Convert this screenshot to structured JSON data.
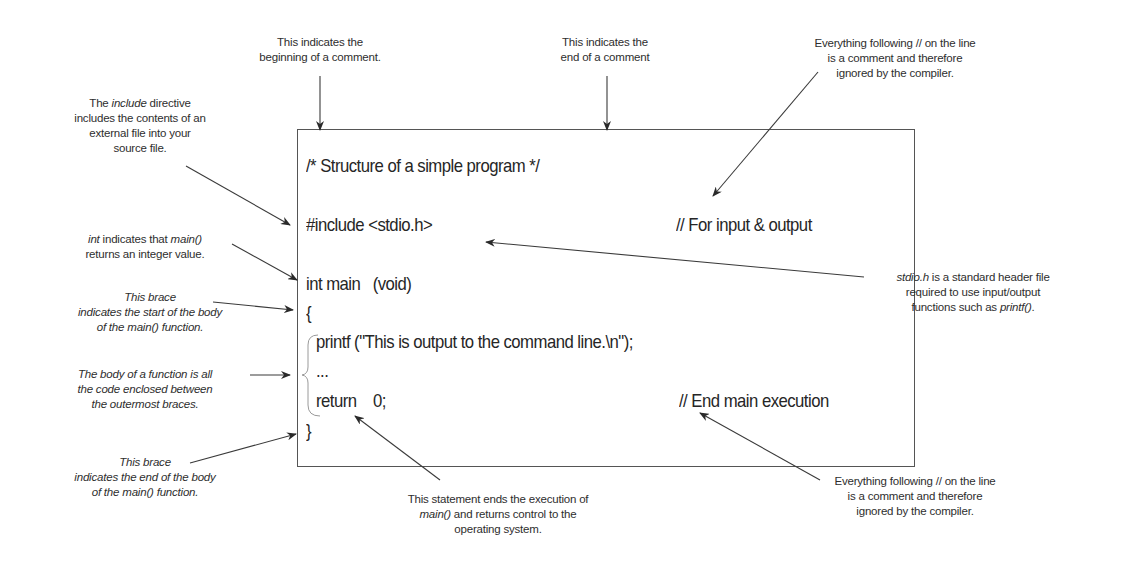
{
  "code": {
    "line_comment": "/* Structure of a simple program */",
    "line_include": "#include <stdio.h>",
    "line_include_comment": "// For input & output",
    "line_main": "int main   (void)",
    "line_open_brace": "{",
    "line_printf": "printf (\"This is output to the command line.\\n\");",
    "line_ellipsis": "...",
    "line_return": "return    0;",
    "line_return_comment": "// End main execution",
    "line_close_brace": "}"
  },
  "annotations": {
    "comment_begin": [
      "This indicates the",
      "beginning of a comment."
    ],
    "comment_end": [
      "This indicates the",
      "end of a comment"
    ],
    "line_comment_top": [
      "Everything following // on the line",
      "is a comment and therefore",
      "ignored by the compiler."
    ],
    "include": {
      "l1_pre": "The ",
      "l1_em": "include",
      "l1_post": " directive",
      "l2": "includes the contents of an",
      "l3": "external file into your",
      "l4": "source file."
    },
    "int_main": {
      "l1_em1": "int",
      "l1_mid": " indicates that ",
      "l1_em2": "main()",
      "l2": "returns an integer value."
    },
    "open_brace": [
      "This brace",
      "indicates the start of the body",
      "of the main() function."
    ],
    "body": [
      "The body of a function is all",
      "the code enclosed between",
      "the outermost braces."
    ],
    "close_brace": [
      "This brace",
      "indicates the end of the body",
      "of the main() function."
    ],
    "stdio": {
      "l1_em": "stdio.h",
      "l1_post": " is a standard header file",
      "l2": "required to use input/output",
      "l3_pre": "functions such as ",
      "l3_em": "printf()",
      "l3_post": "."
    },
    "return": {
      "l1": "This statement ends the execution of",
      "l2_em": "main()",
      "l2_post": " and returns control to the",
      "l3": "operating system."
    },
    "line_comment_bottom": [
      "Everything following // on the line",
      "is a comment and therefore",
      "ignored by the compiler."
    ]
  },
  "colors": {
    "ink": "#2a2a2a",
    "border": "#555555",
    "brace": "#9a9a9a"
  }
}
